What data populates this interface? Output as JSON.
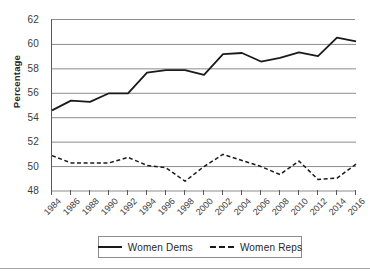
{
  "chart_data": {
    "type": "line",
    "title": "",
    "xlabel": "",
    "ylabel": "Percentage",
    "ylim": [
      48,
      62
    ],
    "ytick_step": 2,
    "yticks": [
      62,
      60,
      58,
      56,
      54,
      52,
      50,
      48
    ],
    "grid": true,
    "grid_axis": "y",
    "legend_position": "bottom-center",
    "categories": [
      1984,
      1986,
      1988,
      1990,
      1992,
      1994,
      1996,
      1998,
      2000,
      2002,
      2004,
      2006,
      2008,
      2010,
      2012,
      2014,
      2016
    ],
    "xtick_labels": [
      "1984",
      "1986",
      "1988",
      "1990",
      "1992",
      "1994",
      "1996",
      "1998",
      "2000",
      "2002",
      "2004",
      "2006",
      "2008",
      "2010",
      "2012",
      "2014",
      "2016"
    ],
    "series": [
      {
        "name": "Women Dems",
        "style": "solid",
        "color": "#1a1a1a",
        "values": [
          54.6,
          55.4,
          55.3,
          56.0,
          56.0,
          57.7,
          57.9,
          57.9,
          57.5,
          59.2,
          59.3,
          58.6,
          58.9,
          59.35,
          59.05,
          60.55,
          60.25
        ]
      },
      {
        "name": "Women Reps",
        "style": "dashed",
        "color": "#1a1a1a",
        "values": [
          50.9,
          50.3,
          50.3,
          50.3,
          50.75,
          50.1,
          49.9,
          48.8,
          50.0,
          51.0,
          50.5,
          50.0,
          49.35,
          50.45,
          48.95,
          49.05,
          50.2
        ]
      }
    ]
  },
  "legend": {
    "entries": [
      {
        "label": "Women Dems"
      },
      {
        "label": "Women Reps"
      }
    ]
  },
  "axis": {
    "y_title": "Percentage"
  },
  "colors": {
    "series_line": "#1a1a1a",
    "gridline": "#8c8c8c",
    "axis": "#595959",
    "text": "#3c3c3c",
    "background": "#ffffff"
  }
}
